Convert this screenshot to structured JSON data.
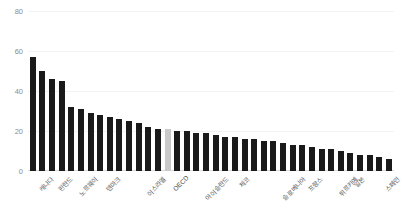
{
  "chart_data": {
    "type": "bar",
    "title": "",
    "subtitle": "",
    "xlabel": "",
    "ylabel": "",
    "ylim": [
      0,
      80
    ],
    "yticks": [
      0,
      20,
      40,
      60,
      80
    ],
    "grid": true,
    "legend": "none",
    "highlight_category": "OECD",
    "highlight_color": "#c9c9c9",
    "bar_color": "#1a1a1a",
    "categories": [
      "캐나다",
      "아일랜드",
      "핀란드",
      "룩셈부르크",
      "노르웨이",
      "호주",
      "영국",
      "덴마크",
      "스위스",
      "네덜란드",
      "미국",
      "이스라엘",
      "스웨덴",
      "뉴질랜드",
      "OECD",
      "벨기에",
      "에스토니아",
      "아이슬란드",
      "라트비아",
      "오스트리아",
      "폴란드",
      "체코",
      "독일",
      "리투아니아",
      "헝가리",
      "슬로베니아",
      "포르투갈",
      "그리스",
      "프랑스",
      "슬로바키아",
      "칠레",
      "튀르키예",
      "이탈리아",
      "일본",
      "멕시코",
      "콜롬비아",
      "스페인",
      "코스타리카"
    ],
    "values": [
      57,
      50,
      46,
      45,
      32,
      31,
      29,
      28,
      27,
      26,
      25,
      24,
      22,
      21,
      21,
      20,
      20,
      19,
      19,
      18,
      17,
      17,
      16,
      16,
      15,
      15,
      14,
      13,
      13,
      12,
      11,
      11,
      10,
      9,
      8,
      8,
      7,
      6
    ]
  },
  "yaxis": {
    "ticks": [
      "80",
      "60",
      "40",
      "20",
      "0"
    ]
  }
}
